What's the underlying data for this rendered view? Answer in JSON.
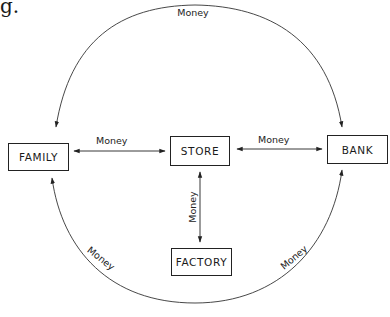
{
  "fragment_text": "g.",
  "nodes": {
    "family": "FAMILY",
    "store": "STORE",
    "bank": "BANK",
    "factory": "FACTORY"
  },
  "edges": {
    "top_arc": {
      "label": "Money",
      "from": "BANK",
      "to": "FAMILY",
      "note": "arrowheads at both FAMILY and BANK"
    },
    "family_store": {
      "label": "Money",
      "from": "FAMILY",
      "to": "STORE",
      "bidirectional": true
    },
    "store_bank": {
      "label": "Money",
      "from": "STORE",
      "to": "BANK",
      "bidirectional": true
    },
    "store_factory": {
      "label": "Money",
      "from": "STORE",
      "to": "FACTORY",
      "bidirectional": true
    },
    "bottom_arc_left": {
      "label": "Money",
      "to": "FAMILY"
    },
    "bottom_arc_right": {
      "label": "Money",
      "to": "BANK"
    }
  },
  "colors": {
    "line": "#333333",
    "text": "#1a1a1a",
    "background": "#ffffff"
  }
}
